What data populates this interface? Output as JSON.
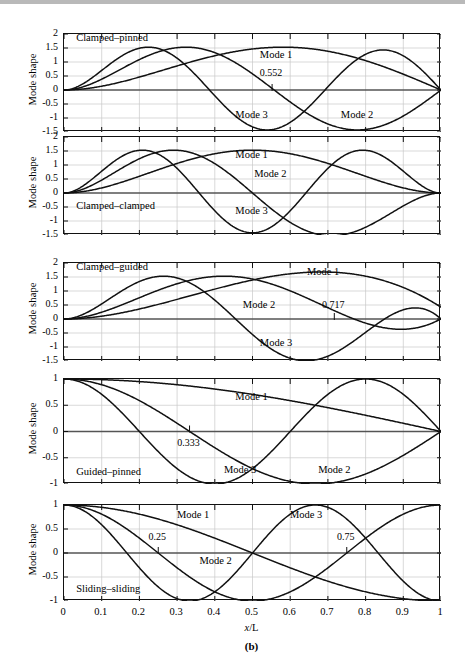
{
  "figure": {
    "caption": "(b)",
    "xlabel_italic": "x",
    "xlabel_rest": "/L",
    "ylabel": "Mode shape"
  },
  "axis": {
    "xticks": [
      "0",
      "0.1",
      "0.2",
      "0.3",
      "0.4",
      "0.5",
      "0.6",
      "0.7",
      "0.8",
      "0.9",
      "1"
    ],
    "xvalues": [
      0,
      0.1,
      0.2,
      0.3,
      0.4,
      0.5,
      0.6,
      0.7,
      0.8,
      0.9,
      1
    ],
    "yticks_large": [
      "2",
      "1.5",
      "1",
      "0.5",
      "0",
      "-0.5",
      "-1",
      "-1.5"
    ],
    "yvalues_large": [
      2,
      1.5,
      1,
      0.5,
      0,
      -0.5,
      -1,
      -1.5
    ],
    "yticks_small": [
      "1",
      "0.5",
      "0",
      "-0.5",
      "-1"
    ],
    "yvalues_small": [
      1,
      0.5,
      0,
      -0.5,
      -1
    ],
    "xlim": [
      0,
      1
    ],
    "ylim_large": [
      -1.5,
      2
    ],
    "ylim_small": [
      -1,
      1
    ]
  },
  "chart_data": {
    "type": "line",
    "xlabel": "x/L",
    "ylabel": "Mode shape",
    "xlim": [
      0,
      1
    ],
    "grid": true,
    "legend": "inline-annotations",
    "panels": [
      {
        "id": "clamped-pinned",
        "boundary_condition": "Clamped–pinned",
        "ylim": [
          -1.5,
          2
        ],
        "yticks": [
          2,
          1.5,
          1,
          0.5,
          0,
          -0.5,
          -1,
          -1.5
        ],
        "beta_L": [
          3.92660231,
          7.06858275,
          10.21017612
        ],
        "type": "clamped-pinned",
        "series": [
          {
            "name": "Mode 1",
            "label_x": 0.565,
            "label_y": 1.18
          },
          {
            "name": "Mode 2",
            "label_x": 0.78,
            "label_y": -0.98
          },
          {
            "name": "Mode 3",
            "label_x": 0.5,
            "label_y": -0.95
          }
        ],
        "annotations": [
          {
            "text": "0.552",
            "x": 0.552,
            "y": 0.52,
            "node_of": "Mode 2"
          }
        ]
      },
      {
        "id": "clamped-clamped",
        "boundary_condition": "Clamped–clamped",
        "ylim": [
          -1.5,
          2
        ],
        "yticks": [
          2,
          1.5,
          1,
          0.5,
          0,
          -0.5,
          -1,
          -1.5
        ],
        "beta_L": [
          4.73004074,
          7.85320462,
          10.99560784
        ],
        "type": "clamped-clamped",
        "series": [
          {
            "name": "Mode 1",
            "label_x": 0.5,
            "label_y": 1.3
          },
          {
            "name": "Mode 2",
            "label_x": 0.55,
            "label_y": 0.62
          },
          {
            "name": "Mode 3",
            "label_x": 0.5,
            "label_y": -0.72
          }
        ],
        "annotations": []
      },
      {
        "id": "clamped-guided",
        "boundary_condition": "Clamped–guided",
        "ylim": [
          -1.5,
          2
        ],
        "yticks": [
          2,
          1.5,
          1,
          0.5,
          0,
          -0.5,
          -1,
          -1.5
        ],
        "beta_L": [
          2.36502037,
          5.49780392,
          8.63937983
        ],
        "type": "clamped-guided",
        "series": [
          {
            "name": "Mode 1",
            "label_x": 0.69,
            "label_y": 1.6
          },
          {
            "name": "Mode 2",
            "label_x": 0.52,
            "label_y": 0.42
          },
          {
            "name": "Mode 3",
            "label_x": 0.565,
            "label_y": -0.93
          }
        ],
        "annotations": [
          {
            "text": "0.717",
            "x": 0.717,
            "y": 0.42,
            "node_of": "Mode 2"
          }
        ]
      },
      {
        "id": "guided-pinned",
        "boundary_condition": "Guided–pinned",
        "ylim": [
          -1,
          1
        ],
        "yticks": [
          1,
          0.5,
          0,
          -0.5,
          -1
        ],
        "type": "guided-pinned",
        "series": [
          {
            "name": "Mode 1",
            "label_x": 0.5,
            "label_y": 0.62
          },
          {
            "name": "Mode 2",
            "label_x": 0.72,
            "label_y": -0.78
          },
          {
            "name": "Mode 3",
            "label_x": 0.47,
            "label_y": -0.78
          }
        ],
        "annotations": [
          {
            "text": "0.333",
            "x": 0.333,
            "y": -0.26,
            "node_of": "Mode 2"
          }
        ]
      },
      {
        "id": "sliding-sliding",
        "boundary_condition": "Sliding–sliding",
        "ylim": [
          -1,
          1
        ],
        "yticks": [
          1,
          0.5,
          0,
          -0.5,
          -1
        ],
        "type": "sliding-sliding",
        "series": [
          {
            "name": "Mode 1",
            "label_x": 0.345,
            "label_y": 0.74
          },
          {
            "name": "Mode 2",
            "label_x": 0.405,
            "label_y": -0.2
          },
          {
            "name": "Mode 3",
            "label_x": 0.645,
            "label_y": 0.74
          }
        ],
        "annotations": [
          {
            "text": "0.25",
            "x": 0.25,
            "y": 0.3,
            "node_of": "Mode 2"
          },
          {
            "text": "0.75",
            "x": 0.75,
            "y": 0.3,
            "node_of": "Mode 2"
          }
        ]
      }
    ]
  },
  "colors": {
    "curve": "#111111",
    "grid": "#c9c9c9",
    "axis": "#111111",
    "background": "#ffffff"
  }
}
